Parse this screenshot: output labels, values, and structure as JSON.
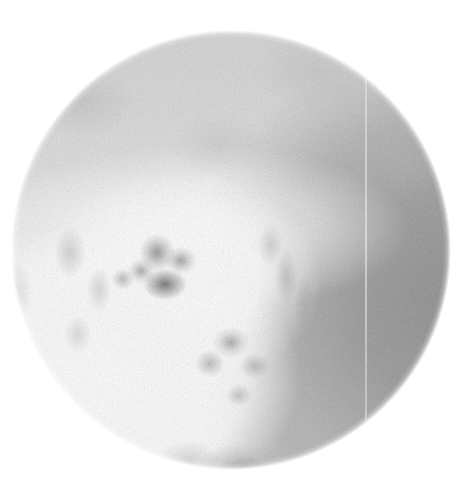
{
  "image": {
    "kind": "radiograph",
    "modality_hint": "fluoroscopy / plain-film spot view",
    "field_of_view": "circular",
    "canvas": {
      "width": 469,
      "height": 491
    },
    "background_color": "#ffffff",
    "circle": {
      "center_x": 231,
      "center_y": 250,
      "radius": 220,
      "edge": "feathered"
    },
    "tones": {
      "outside_field": "#ffffff",
      "brightest_tissue": "#ffffff",
      "upper_soft_tissue": "#d8d8d8",
      "right_hemisphere_dark": "#909090",
      "darkest_structure": "#686868"
    },
    "artifacts": {
      "vertical_seam_x": 365,
      "seam_description": "faint light vertical line",
      "grain": "fine quantum mottle / film grain"
    },
    "regions": [
      {
        "name": "upper-soft-tissue-band",
        "tone": "#d8d8d8",
        "note": "uniform light grey, fine mottle"
      },
      {
        "name": "bright-overexposed-lower-left",
        "tone": "#ffffff",
        "note": "washed-out white lobe"
      },
      {
        "name": "central-dark-cluster",
        "tone": "#686868",
        "note": "darkest nodular opacities near centre"
      },
      {
        "name": "lower-mid-nodular-cluster",
        "tone": "#8e8e8e",
        "note": "grouped rounded densities"
      },
      {
        "name": "right-dark-hemisphere",
        "tone": "#909090",
        "note": "denser tissue occupying right half"
      },
      {
        "name": "inferior-dense-shadow",
        "tone": "#8c8c8c",
        "note": "dark shadow at lower border of aperture"
      },
      {
        "name": "left-edge-grey-patch",
        "tone": "#a2a2a2",
        "note": "mid-grey patch at left margin"
      }
    ]
  }
}
